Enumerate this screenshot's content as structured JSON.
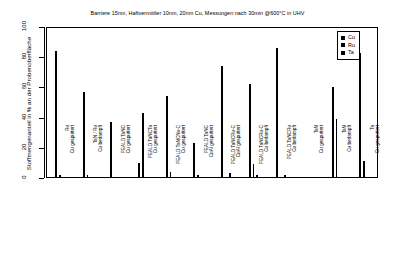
{
  "chart_data": {
    "type": "bar",
    "title": "Barriere 15nm, Haftvermittler 10nm, 20nm Cu, Messungen nach 30min @600°C in UHV",
    "xlabel": "",
    "ylabel": "Stoffmengenanteil in % an der Probenoberfläche",
    "ylim": [
      0,
      100
    ],
    "yticks": [
      0,
      20,
      40,
      60,
      80,
      100
    ],
    "grid": false,
    "legend_position": "top-right",
    "legend": [
      "Cu",
      "Ru",
      "Ta"
    ],
    "categories": [
      "Ru\nCu gesputtert",
      "TaN / Ru\nCu bedampft",
      "PEALD TaNC\nCu gesputtert",
      "PEALD TaNCTa\nCu gesputtert",
      "PEALD TaNCNx-C\nCu gesputtert",
      "PEALD TaNC\nCuAl gesputtert",
      "PEALD TaNCRu-C\nCuAl gesputtert",
      "PEALD TaNCRu-C\nCu bedampft",
      "PEALD TaNCRu\nCu bedampft",
      "TaN\nCu gesputtert",
      "TaN\nCu bedampft",
      "Ta\nCu gesputtert"
    ],
    "categories_lines": [
      [
        "Ru",
        "Cu gesputtert"
      ],
      [
        "TaN / Ru",
        "Cu bedampft"
      ],
      [
        "PEALD TaNC",
        "Cu gesputtert"
      ],
      [
        "PEALD TaNCTa",
        "Cu gesputtert"
      ],
      [
        "PEALD TaNCNx-C",
        "Cu gesputtert"
      ],
      [
        "PEALD TaNC",
        "CuAl gesputtert"
      ],
      [
        "PEALD TaNCRu-C",
        "CuAl gesputtert"
      ],
      [
        "PEALD TaNCRu-C",
        "Cu bedampft"
      ],
      [
        "PEALD TaNCRu",
        "Cu bedampft"
      ],
      [
        "TaN",
        "Cu gesputtert"
      ],
      [
        "TaN",
        "Cu bedampft"
      ],
      [
        "Ta",
        "Cu gesputtert"
      ]
    ],
    "series": [
      {
        "name": "Cu",
        "color": "#000000",
        "values": [
          84,
          57,
          37,
          10,
          54,
          23,
          74,
          62,
          86,
          1,
          60,
          83
        ]
      },
      {
        "name": "Ru",
        "color": "#000000",
        "values": [
          2,
          2,
          0,
          43,
          4,
          2,
          1,
          9,
          1,
          0,
          39,
          11
        ]
      },
      {
        "name": "Ta",
        "color": "#000000",
        "values": [
          0,
          0,
          0,
          0,
          0,
          0,
          3,
          2,
          2,
          0,
          0,
          0
        ]
      }
    ]
  },
  "legend": {
    "items": [
      {
        "label": "Cu"
      },
      {
        "label": "Ru"
      },
      {
        "label": "Ta"
      }
    ]
  }
}
